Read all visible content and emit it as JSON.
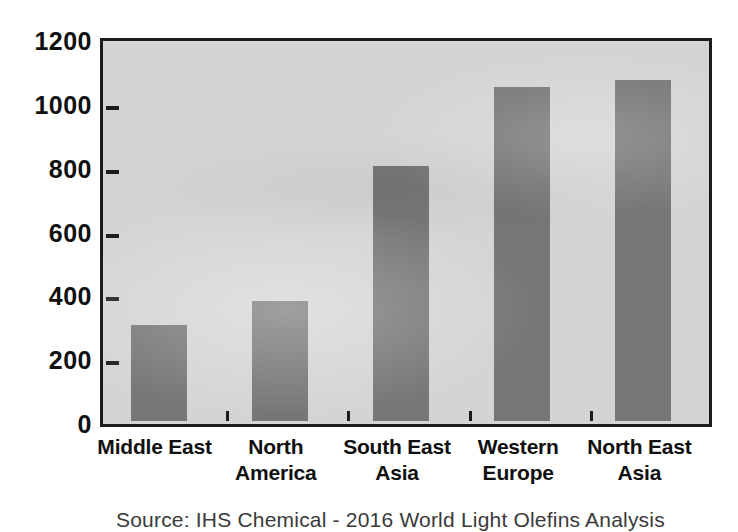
{
  "chart_data": {
    "type": "bar",
    "title": "",
    "subtitle": "",
    "xlabel": "",
    "ylabel": "",
    "categories": [
      "Middle East",
      "North America",
      "South East Asia",
      "Western Europe",
      "North East Asia"
    ],
    "category_lines": [
      [
        "Middle East",
        ""
      ],
      [
        "North",
        "America"
      ],
      [
        "South East",
        "Asia"
      ],
      [
        "Western",
        "Europe"
      ],
      [
        "North East",
        "Asia"
      ]
    ],
    "values": [
      300,
      375,
      800,
      1045,
      1070
    ],
    "ylim": [
      0,
      1200
    ],
    "y_ticks": [
      0,
      200,
      400,
      600,
      800,
      1000,
      1200
    ],
    "y_tick_labels": [
      "0",
      "200",
      "400",
      "600",
      "800",
      "1000",
      "1200"
    ],
    "grid": false,
    "legend": false,
    "legend_position": "none",
    "bar_color": "#767676",
    "plot_background": "#d4d4d4",
    "axis_color": "#1c1c1c",
    "annotations": []
  },
  "caption": {
    "source_note": "Source: IHS Chemical - 2016 World Light Olefins Analysis"
  }
}
